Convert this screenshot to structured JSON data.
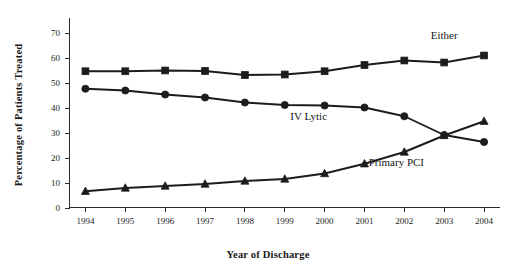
{
  "chart_data": {
    "type": "line",
    "title": "",
    "xlabel": "Year of Discharge",
    "ylabel": "Percentage of Patients Treated",
    "x": [
      1994,
      1995,
      1996,
      1997,
      1998,
      1999,
      2000,
      2001,
      2002,
      2003,
      2004
    ],
    "categories": [
      "1994",
      "1995",
      "1996",
      "1997",
      "1998",
      "1999",
      "2000",
      "2001",
      "2002",
      "2003",
      "2004"
    ],
    "xlim": [
      1993.6,
      2004.4
    ],
    "ylim": [
      0,
      72
    ],
    "yticks": [
      0,
      10,
      20,
      30,
      40,
      50,
      60,
      70
    ],
    "ytick_labels": [
      "0",
      "10",
      "20",
      "30",
      "40",
      "50",
      "60",
      "70"
    ],
    "grid": false,
    "legend": "inline-annotations",
    "series": [
      {
        "name": "Either",
        "marker": "square",
        "color": "#1c1c1c",
        "label_x": 2003.0,
        "label_y": 67.5,
        "values": [
          54.5,
          54.5,
          54.8,
          54.6,
          53.0,
          53.2,
          54.5,
          57.0,
          58.8,
          58.0,
          60.8
        ]
      },
      {
        "name": "IV Lytic",
        "marker": "circle",
        "color": "#1c1c1c",
        "label_x": 1999.6,
        "label_y": 35.0,
        "values": [
          47.5,
          46.8,
          45.2,
          44.0,
          42.0,
          41.0,
          40.8,
          40.0,
          36.5,
          29.0,
          26.2
        ]
      },
      {
        "name": "Primary PCI",
        "marker": "triangle",
        "color": "#1c1c1c",
        "label_x": 2001.8,
        "label_y": 16.5,
        "values": [
          6.5,
          7.8,
          8.6,
          9.4,
          10.6,
          11.4,
          13.6,
          17.5,
          22.2,
          28.8,
          34.5
        ]
      }
    ]
  },
  "axes": {
    "y_axis_title": "Percentage of Patients Treated",
    "x_axis_title": "Year of Discharge"
  }
}
